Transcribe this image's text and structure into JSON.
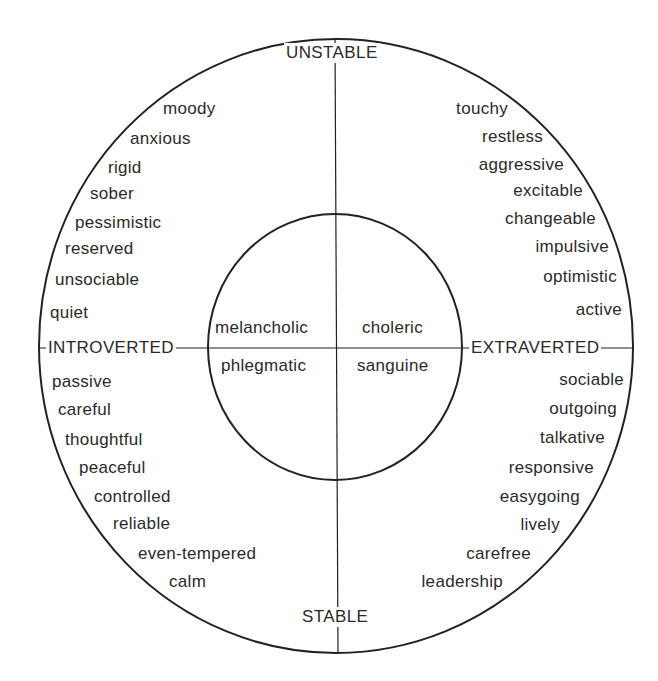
{
  "diagram": {
    "type": "personality-circle",
    "axes": {
      "top": "UNSTABLE",
      "bottom": "STABLE",
      "left": "INTROVERTED",
      "right": "EXTRAVERTED"
    },
    "temperaments": {
      "top_left": "melancholic",
      "top_right": "choleric",
      "bottom_left": "phlegmatic",
      "bottom_right": "sanguine"
    },
    "traits": {
      "unstable_introverted": [
        "moody",
        "anxious",
        "rigid",
        "sober",
        "pessimistic",
        "reserved",
        "unsociable",
        "quiet"
      ],
      "unstable_extraverted": [
        "touchy",
        "restless",
        "aggressive",
        "excitable",
        "changeable",
        "impulsive",
        "optimistic",
        "active"
      ],
      "stable_introverted": [
        "passive",
        "careful",
        "thoughtful",
        "peaceful",
        "controlled",
        "reliable",
        "even-tempered",
        "calm"
      ],
      "stable_extraverted": [
        "sociable",
        "outgoing",
        "talkative",
        "responsive",
        "easygoing",
        "lively",
        "carefree",
        "leadership"
      ]
    },
    "colors": {
      "line": "#222222",
      "text": "#2a2a2a",
      "background": "#ffffff"
    }
  }
}
